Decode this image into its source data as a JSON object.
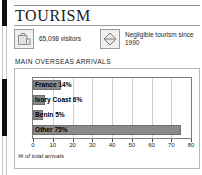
{
  "page": {
    "title": "TOURISM"
  },
  "stats": [
    {
      "icon": "suitcase-icon",
      "text": "65,098 visitors"
    },
    {
      "icon": "diamond-icon",
      "text": "Negligible tourism since 1990"
    }
  ],
  "section": {
    "heading": "MAIN OVERSEAS ARRIVALS"
  },
  "chart_data": {
    "type": "bar",
    "orientation": "horizontal",
    "title": "MAIN OVERSEAS ARRIVALS",
    "xlabel": "% of total arrivals",
    "ylabel": "",
    "categories": [
      "France",
      "Ivory Coast",
      "Benin",
      "Other"
    ],
    "values": [
      14,
      6,
      5,
      75
    ],
    "bar_labels": [
      "France 14%",
      "Ivory Coast 6%",
      "Benin 5%",
      "Other 75%"
    ],
    "xlim": [
      0,
      80
    ],
    "xticks": [
      0,
      10,
      20,
      30,
      40,
      50,
      60,
      70,
      80
    ],
    "xtick_labels": [
      "0",
      "10",
      "20",
      "30",
      "40",
      "50",
      "60",
      "70",
      "80"
    ],
    "grid": true,
    "legend": "none",
    "bar_color": "#8a8a8a",
    "bar_border_color": "#6f6f6f"
  },
  "colors": {
    "title_text": "#1a1a1a",
    "body_text": "#1d1d1d",
    "rule": "#8d8d8d",
    "panel_border": "#b6b6b6",
    "plot_border": "#7f7f7f",
    "grid": "#cfcfcf",
    "spine": "#111111"
  }
}
